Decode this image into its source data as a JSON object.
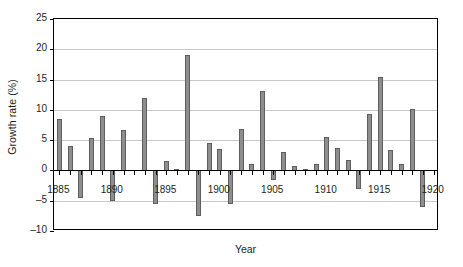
{
  "chart_data": {
    "type": "bar",
    "title": "",
    "xlabel": "Year",
    "ylabel": "Growth rate (%)",
    "xlim": [
      1884.5,
      1920.5
    ],
    "ylim": [
      -10,
      25
    ],
    "yticks": [
      25,
      20,
      15,
      10,
      5,
      0,
      -5,
      -10
    ],
    "ytick_labels": [
      "25",
      "20",
      "15",
      "10",
      "5",
      "0",
      "-5",
      "-10"
    ],
    "xticks": [
      1885,
      1890,
      1895,
      1900,
      1905,
      1910,
      1915,
      1920
    ],
    "xtick_labels": [
      "1885",
      "1890",
      "1895",
      "1900",
      "1905",
      "1910",
      "1915",
      "1920"
    ],
    "grid": true,
    "grid_axis": "y",
    "legend": false,
    "bar_color": "#8e8e8e",
    "bar_edge_color": "#5e5e5e",
    "axis_color": "#000000",
    "gridline_color": "#c8c8c8",
    "categories": [
      1885,
      1886,
      1887,
      1888,
      1889,
      1890,
      1891,
      1892,
      1893,
      1894,
      1895,
      1896,
      1897,
      1898,
      1899,
      1900,
      1901,
      1902,
      1903,
      1904,
      1905,
      1906,
      1907,
      1908,
      1909,
      1910,
      1911,
      1912,
      1913,
      1914,
      1915,
      1916,
      1917,
      1918,
      1919,
      1920
    ],
    "values": [
      8.5,
      4.0,
      -4.5,
      5.3,
      9.0,
      -5.0,
      6.7,
      0.0,
      12.0,
      -5.5,
      1.5,
      0.3,
      19.0,
      -7.5,
      4.5,
      3.5,
      -5.5,
      6.9,
      1.0,
      13.1,
      -1.5,
      3.0,
      0.8,
      0.3,
      1.0,
      5.5,
      3.7,
      1.8,
      -3.0,
      9.3,
      15.5,
      3.3,
      1.0,
      10.2,
      -6.0,
      0.0
    ],
    "series_name": "Growth rate"
  },
  "axes": {
    "ylabel": "Growth rate (%)",
    "xlabel": "Year"
  }
}
